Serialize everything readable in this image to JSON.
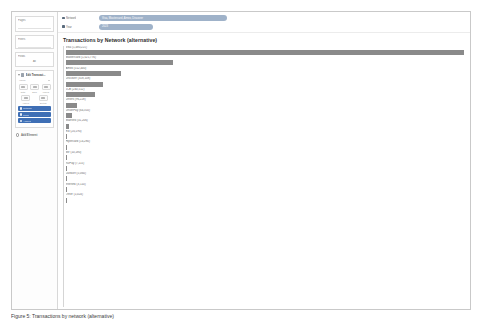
{
  "figure": {
    "caption": "Figure 5: Transactions by network (alternative)"
  },
  "sidebar": {
    "sections": [
      {
        "label": "Pages"
      },
      {
        "label": "Filters"
      },
      {
        "label": "Fields"
      }
    ],
    "fields_value": "All",
    "panel": {
      "caret_icon": "caret-down-icon",
      "panel_icon": "table-icon",
      "title": "Edit Transact...",
      "subheader": "Visual",
      "subheader_chevron": "chevron-down-icon",
      "tools_row1": [
        {
          "icon": "align-left-icon",
          "caption": "Data"
        },
        {
          "icon": "align-center-icon",
          "caption": "Bars"
        },
        {
          "icon": "align-right-icon",
          "caption": "Labels"
        }
      ],
      "tools_row2": [
        {
          "icon": "values-icon",
          "caption": "Values"
        },
        {
          "icon": "sort-icon",
          "caption": "Sorting"
        }
      ],
      "selected_rows": [
        {
          "icon": "field-icon",
          "label": "Network"
        },
        {
          "icon": "field-icon",
          "label": "Count"
        },
        {
          "icon": "field-icon",
          "label": "Amount"
        }
      ]
    },
    "footer": {
      "icon": "gear-icon",
      "label": "Add Element"
    }
  },
  "filters": {
    "rows": [
      {
        "bullet_icon": "filter-icon",
        "key": "Network",
        "value": "Visa, Mastercard, Amex, Discover",
        "pill_width": "wide"
      },
      {
        "bullet_icon": "filter-icon",
        "key": "Year",
        "value": "2023",
        "pill_width": "narrow"
      }
    ]
  },
  "chart_data": {
    "type": "bar",
    "orientation": "horizontal",
    "title": "Transactions by Network (alternative)",
    "xlabel": "",
    "ylabel": "",
    "grid": false,
    "legend": false,
    "bar_color": "#8a8a8a",
    "xlim": [
      0,
      100
    ],
    "categories": [
      "Visa (1,480,221)",
      "Mastercard (1,021,776)",
      "Amex (512,440)",
      "Discover (318,108)",
      "JCB (240,512)",
      "Diners (96,228)",
      "UnionPay (64,310)",
      "Maestro (31,206)",
      "Elo (20,190)",
      "Hipercard (14,280)",
      "Mir (10,180)",
      "RuPay (7,115)",
      "Dankort (5,060)",
      "Interlink (3,110)",
      "Other (1,024)"
    ],
    "values": [
      100,
      27,
      14,
      9.5,
      7.5,
      3.0,
      1.6,
      0.8,
      0.5,
      0.35,
      0.25,
      0.2,
      0.15,
      0.1,
      0.05
    ],
    "value_labels": [
      "1,480,221",
      "1,021,776",
      "512,440",
      "318,108",
      "240,512",
      "96,228",
      "64,310",
      "31,206",
      "20,190",
      "14,280",
      "10,180",
      "7,115",
      "5,060",
      "3,110",
      "1,024"
    ]
  }
}
